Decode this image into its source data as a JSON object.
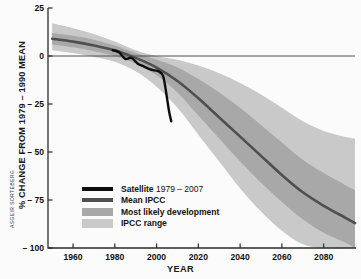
{
  "figure": {
    "credit": "ASGEIR SORTEBERG"
  },
  "chart_data": {
    "type": "line",
    "title": "",
    "xlabel": "YEAR",
    "ylabel": "% CHANGE FROM 1979 – 1990 MEAN",
    "xlim": [
      1948,
      2095
    ],
    "ylim": [
      -100,
      25
    ],
    "xticks": [
      1960,
      1980,
      2000,
      2020,
      2040,
      2060,
      2080
    ],
    "xticklabels": [
      "1960",
      "1980",
      "2000",
      "2020",
      "2040",
      "2060",
      "2080"
    ],
    "yticks": [
      25,
      0,
      -25,
      -50,
      -75,
      -100
    ],
    "yticklabels": [
      "25",
      "0",
      "– 25",
      "– 50",
      "– 75",
      "– 100"
    ],
    "grid": false,
    "zero_line": true,
    "legend_position": "lower-left-inside",
    "colors": {
      "satellite": "#0d0d0d",
      "mean_ipcc": "#4f4f4f",
      "most_likely_band": "#a8a8a8",
      "ipcc_range_band": "#c9c9c9",
      "axis": "#2b2b2b",
      "background": "#fbfbfb"
    },
    "series": [
      {
        "name": "Satellite 1979 – 2007",
        "type": "line",
        "color": "#0d0d0d",
        "x": [
          1979,
          1982,
          1985,
          1988,
          1991,
          1994,
          1997,
          1999,
          2001,
          2003,
          2004,
          2005,
          2006,
          2007
        ],
        "values": [
          3.0,
          2.0,
          -1.5,
          -1.0,
          -4.0,
          -5.5,
          -7.0,
          -7.5,
          -8.0,
          -10.0,
          -15.0,
          -22.0,
          -29.0,
          -34.0
        ]
      },
      {
        "name": "Mean IPCC",
        "type": "line",
        "color": "#4f4f4f",
        "x": [
          1950,
          1960,
          1970,
          1980,
          1990,
          2000,
          2010,
          2020,
          2030,
          2040,
          2050,
          2060,
          2070,
          2080,
          2090,
          2095
        ],
        "values": [
          9.0,
          7.5,
          5.5,
          3.0,
          -1.0,
          -6.0,
          -13.0,
          -22.0,
          -32.0,
          -42.0,
          -52.0,
          -62.0,
          -71.0,
          -78.0,
          -84.0,
          -87.0
        ]
      },
      {
        "name": "Most likely development",
        "type": "band",
        "color": "#a8a8a8",
        "x": [
          1950,
          1960,
          1970,
          1980,
          1990,
          2000,
          2010,
          2020,
          2030,
          2040,
          2050,
          2060,
          2070,
          2080,
          2090,
          2095
        ],
        "upper": [
          12.0,
          10.5,
          8.5,
          5.5,
          1.5,
          -2.0,
          -6.0,
          -12.0,
          -19.0,
          -27.0,
          -36.0,
          -45.0,
          -54.0,
          -61.0,
          -67.0,
          -70.0
        ],
        "lower": [
          6.0,
          4.5,
          2.5,
          0.0,
          -4.0,
          -10.0,
          -19.0,
          -31.0,
          -43.0,
          -55.0,
          -66.0,
          -76.0,
          -85.0,
          -92.0,
          -97.0,
          -100.0
        ]
      },
      {
        "name": "IPCC range",
        "type": "band",
        "color": "#c9c9c9",
        "x": [
          1950,
          1960,
          1970,
          1980,
          1990,
          2000,
          2010,
          2020,
          2030,
          2040,
          2050,
          2060,
          2070,
          2080,
          2090,
          2095
        ],
        "upper": [
          17.0,
          14.5,
          11.5,
          7.5,
          3.0,
          0.0,
          -2.0,
          -5.0,
          -9.0,
          -14.0,
          -20.0,
          -27.0,
          -34.0,
          -39.0,
          -42.0,
          -43.0
        ],
        "lower": [
          3.0,
          1.5,
          -0.5,
          -3.0,
          -8.0,
          -16.0,
          -27.0,
          -41.0,
          -55.0,
          -69.0,
          -81.0,
          -91.0,
          -98.0,
          -100.0,
          -100.0,
          -100.0
        ]
      }
    ],
    "legend": [
      {
        "label_bold": "Satellite",
        "label_regular": " 1979 – 2007",
        "swatch": "line-black"
      },
      {
        "label_bold": "Mean IPCC",
        "label_regular": "",
        "swatch": "line-dark"
      },
      {
        "label_bold": "Most likely development",
        "label_regular": "",
        "swatch": "band-mid"
      },
      {
        "label_bold": "IPCC range",
        "label_regular": "",
        "swatch": "band-light"
      }
    ]
  }
}
